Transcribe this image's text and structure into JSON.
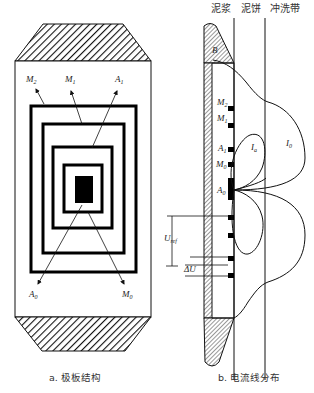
{
  "figure": {
    "panel_a": {
      "caption": "a. 极板结构",
      "labels": {
        "m2": {
          "main": "M",
          "sub": "2"
        },
        "m1": {
          "main": "M",
          "sub": "1"
        },
        "a1": {
          "main": "A",
          "sub": "1"
        },
        "a0": {
          "main": "A",
          "sub": "0"
        },
        "m0": {
          "main": "M",
          "sub": "0"
        }
      }
    },
    "panel_b": {
      "caption": "b. 电流线分布",
      "zones": [
        "泥浆",
        "泥饼",
        "冲洗带"
      ],
      "labels": {
        "b": "B",
        "m2": {
          "main": "M",
          "sub": "2"
        },
        "m1": {
          "main": "M",
          "sub": "1"
        },
        "a1": {
          "main": "A",
          "sub": "1"
        },
        "m0": {
          "main": "M",
          "sub": "0"
        },
        "a0": {
          "main": "A",
          "sub": "0"
        },
        "ia": {
          "main": "I",
          "sub": "a"
        },
        "i0": {
          "main": "I",
          "sub": "0"
        },
        "uref": {
          "main": "U",
          "sub": "ref"
        },
        "delta_u": "ΔU"
      }
    }
  },
  "colors": {
    "ink": "#111111",
    "background": "#ffffff"
  }
}
